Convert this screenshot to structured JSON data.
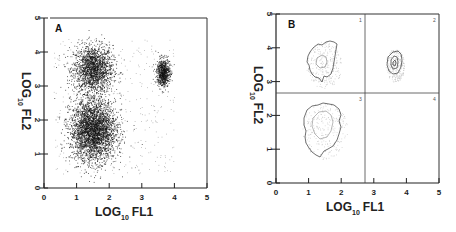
{
  "chart_data": [
    {
      "type": "scatter",
      "panel": "A",
      "title": "",
      "xlabel": "LOG10 FL1",
      "ylabel": "LOG10 FL2",
      "xlim": [
        0,
        5
      ],
      "ylim": [
        0,
        5
      ],
      "xticks": [
        "0",
        "1",
        "2",
        "3",
        "4",
        "5"
      ],
      "yticks": [
        "0",
        "1",
        "2",
        "3",
        "4",
        "5"
      ],
      "grid": false,
      "clusters": [
        {
          "name": "FL1 low / FL2 high",
          "center": [
            1.5,
            3.5
          ],
          "spread": [
            0.3,
            0.35
          ],
          "density": "medium"
        },
        {
          "name": "FL1 low / FL2 low",
          "center": [
            1.5,
            1.7
          ],
          "spread": [
            0.35,
            0.45
          ],
          "density": "high"
        },
        {
          "name": "FL1 high / FL2 high",
          "center": [
            3.65,
            3.4
          ],
          "spread": [
            0.1,
            0.2
          ],
          "density": "high"
        }
      ]
    },
    {
      "type": "contour",
      "panel": "B",
      "title": "",
      "xlabel": "LOG10 FL1",
      "ylabel": "LOG10 FL2",
      "xlim": [
        0,
        5
      ],
      "ylim": [
        0,
        5
      ],
      "xticks": [
        "0",
        "1",
        "2",
        "3",
        "4",
        "5"
      ],
      "yticks": [
        "0",
        "1",
        "2",
        "3",
        "4",
        "5"
      ],
      "grid": false,
      "quadrant_gates": {
        "x": 2.7,
        "y": 2.65
      },
      "quadrant_labels": [
        "1",
        "2",
        "3",
        "4"
      ],
      "clusters": [
        {
          "quadrant": "1",
          "center": [
            1.5,
            3.5
          ],
          "outer_extent_x": [
            1.0,
            1.95
          ],
          "outer_extent_y": [
            2.9,
            4.1
          ]
        },
        {
          "quadrant": "2",
          "center": [
            3.65,
            3.45
          ],
          "outer_extent_x": [
            3.4,
            3.9
          ],
          "outer_extent_y": [
            3.05,
            3.9
          ]
        },
        {
          "quadrant": "3",
          "center": [
            1.5,
            1.6
          ],
          "outer_extent_x": [
            0.9,
            2.1
          ],
          "outer_extent_y": [
            0.8,
            2.3
          ]
        }
      ]
    }
  ],
  "panels": {
    "a": {
      "label": "A",
      "xlabel_main": "LOG",
      "xlabel_sub": "10",
      "xlabel_rest": "FL1",
      "ylabel_main": "LOG",
      "ylabel_sub": "10",
      "ylabel_rest": "FL2"
    },
    "b": {
      "label": "B",
      "xlabel_main": "LOG",
      "xlabel_sub": "10",
      "xlabel_rest": "FL1",
      "ylabel_main": "LOG",
      "ylabel_sub": "10",
      "ylabel_rest": "FL2",
      "q1": "1",
      "q2": "2",
      "q3": "3",
      "q4": "4"
    }
  },
  "ticks": [
    "0",
    "1",
    "2",
    "3",
    "4",
    "5"
  ]
}
